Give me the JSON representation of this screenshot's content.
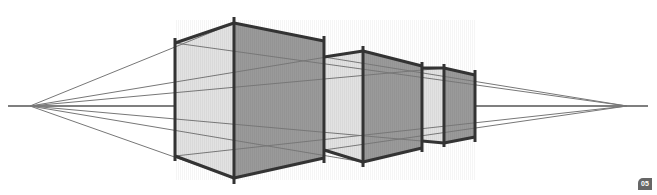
{
  "diagram": {
    "horizon_y": 106,
    "vanishing_points": {
      "left": [
        30,
        106
      ],
      "right": [
        627,
        106
      ]
    },
    "colors": {
      "light_face": "#e2e2e2",
      "dark_face": "#9a9a9a",
      "edge": "#333333",
      "guide": "#777777",
      "horizon": "#555555"
    },
    "badge_label": "05"
  }
}
